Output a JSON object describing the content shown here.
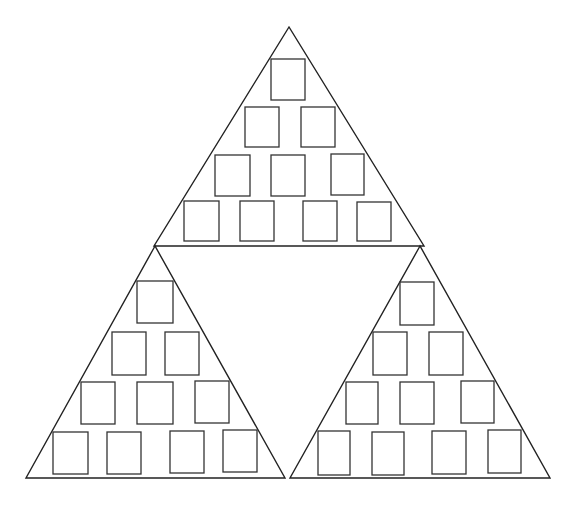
{
  "diagram": {
    "stroke_color": "#222222",
    "background": "#ffffff",
    "triangles": [
      {
        "id": "top",
        "points": [
          [
            289,
            27
          ],
          [
            154,
            246
          ],
          [
            424,
            246
          ]
        ],
        "boxes": [
          [
            271,
            59,
            34,
            41
          ],
          [
            245,
            107,
            34,
            40
          ],
          [
            301,
            107,
            34,
            40
          ],
          [
            215,
            155,
            35,
            41
          ],
          [
            271,
            155,
            34,
            41
          ],
          [
            331,
            154,
            33,
            41
          ],
          [
            184,
            201,
            35,
            40
          ],
          [
            240,
            201,
            34,
            40
          ],
          [
            303,
            201,
            34,
            40
          ],
          [
            357,
            202,
            34,
            39
          ]
        ]
      },
      {
        "id": "bottom-left",
        "points": [
          [
            155,
            246
          ],
          [
            26,
            478
          ],
          [
            285,
            478
          ]
        ],
        "boxes": [
          [
            137,
            281,
            36,
            42
          ],
          [
            112,
            332,
            34,
            43
          ],
          [
            165,
            332,
            34,
            43
          ],
          [
            81,
            382,
            34,
            42
          ],
          [
            137,
            382,
            36,
            42
          ],
          [
            195,
            381,
            34,
            42
          ],
          [
            53,
            432,
            35,
            42
          ],
          [
            107,
            432,
            34,
            42
          ],
          [
            170,
            431,
            34,
            42
          ],
          [
            223,
            430,
            34,
            42
          ]
        ]
      },
      {
        "id": "bottom-right",
        "points": [
          [
            420,
            246
          ],
          [
            290,
            478
          ],
          [
            550,
            478
          ]
        ],
        "boxes": [
          [
            400,
            282,
            34,
            43
          ],
          [
            373,
            332,
            34,
            43
          ],
          [
            429,
            332,
            34,
            43
          ],
          [
            346,
            382,
            32,
            42
          ],
          [
            400,
            382,
            34,
            42
          ],
          [
            461,
            381,
            33,
            42
          ],
          [
            318,
            431,
            32,
            44
          ],
          [
            372,
            432,
            32,
            43
          ],
          [
            432,
            431,
            34,
            43
          ],
          [
            488,
            430,
            33,
            43
          ]
        ]
      }
    ]
  }
}
